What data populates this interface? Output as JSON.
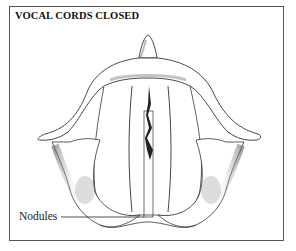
{
  "title": "VOCAL CORDS CLOSED",
  "labels": {
    "nodules": "Nodules"
  },
  "colors": {
    "line": "#333333",
    "shade": "#555555"
  }
}
